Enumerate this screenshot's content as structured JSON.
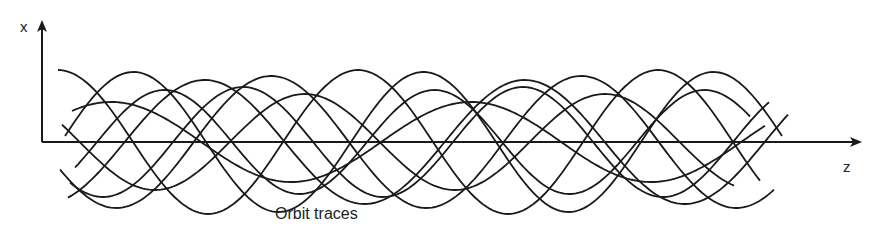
{
  "diagram": {
    "axis_x_label": "x",
    "axis_z_label": "z",
    "caption": "Orbit traces",
    "line_color": "#1a1a1a",
    "origin": [
      42,
      142
    ],
    "x_axis_top": 20,
    "z_axis_end": 862,
    "traces": [
      {
        "amp": 72,
        "wavelength": 300,
        "phase": 0.0,
        "start": 58,
        "end": 760
      },
      {
        "amp": 48,
        "wavelength": 300,
        "phase": 1.2,
        "start": 62,
        "end": 735
      },
      {
        "amp": 55,
        "wavelength": 280,
        "phase": 2.4,
        "start": 70,
        "end": 770
      },
      {
        "amp": 62,
        "wavelength": 320,
        "phase": 3.6,
        "start": 68,
        "end": 790
      },
      {
        "amp": 70,
        "wavelength": 290,
        "phase": 4.8,
        "start": 65,
        "end": 782
      },
      {
        "amp": 40,
        "wavelength": 360,
        "phase": 5.6,
        "start": 72,
        "end": 765
      },
      {
        "amp": 66,
        "wavelength": 310,
        "phase": 2.0,
        "start": 60,
        "end": 775
      },
      {
        "amp": 52,
        "wavelength": 270,
        "phase": 4.2,
        "start": 75,
        "end": 750
      }
    ]
  }
}
